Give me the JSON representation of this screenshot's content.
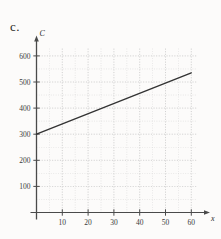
{
  "figure": {
    "part_label": "c."
  },
  "chart_data": {
    "type": "line",
    "title": "",
    "xlabel": "x",
    "ylabel": "C",
    "xlim": [
      0,
      63
    ],
    "ylim": [
      0,
      640
    ],
    "grid": true,
    "grid_style": "dotted",
    "legend": "none",
    "x_ticks": [
      10,
      20,
      30,
      40,
      50,
      60
    ],
    "x_tick_labels": [
      "10",
      "20",
      "30",
      "40",
      "50",
      "60"
    ],
    "x_minor_step": 5,
    "y_ticks": [
      100,
      200,
      300,
      400,
      500,
      600
    ],
    "y_tick_labels": [
      "100",
      "200",
      "300",
      "400",
      "500",
      "600"
    ],
    "y_minor_step": 50,
    "series": [
      {
        "name": "C(x)",
        "x": [
          0,
          60
        ],
        "values": [
          300,
          535
        ],
        "intercept": 300,
        "slope": 3.9,
        "color": "#333333"
      }
    ]
  },
  "colors": {
    "axis": "#4a4a4a",
    "grid": "#bdbdbd",
    "line": "#2f2f2f",
    "text": "#2b2b2b",
    "background": "#fcfbfa"
  }
}
